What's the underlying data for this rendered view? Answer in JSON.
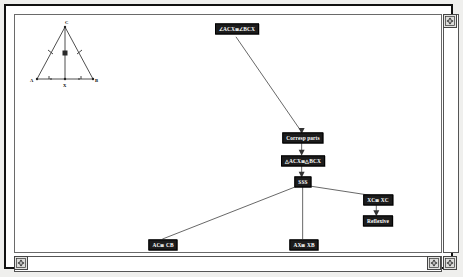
{
  "window": {
    "title": "Geometry Proof Tree",
    "background_color": "#ffffff",
    "frame_color": "#111111",
    "node_fill_color": "#1c1c1c",
    "node_text_color": "#ffffff",
    "edge_color": "#555555"
  },
  "scrollbars": {
    "vertical": {
      "name": "vertical-scrollbar",
      "up_arrow": "⇕"
    },
    "horizontal": {
      "name": "horizontal-scrollbar",
      "left_arrow": "⇔",
      "right_arrow": "⇔"
    },
    "corner": {
      "name": "resize-corner",
      "glyph": "⇕"
    }
  },
  "diagram": {
    "name": "isosceles-triangle-figure",
    "vertex_labels": [
      "A",
      "B",
      "C"
    ],
    "midpoint_label": "X",
    "marks": {
      "leg_ticks": 1,
      "base_ticks": 1,
      "right_angle_mark": true
    }
  },
  "proof_tree": {
    "nodes": [
      {
        "id": "angles",
        "label": "∠ACX≅∠BCX",
        "x": 224,
        "y": 20,
        "name": "node-angle-congruence"
      },
      {
        "id": "corresp",
        "label": "Corresp parts",
        "x": 295,
        "y": 127,
        "name": "node-corresponding-parts"
      },
      {
        "id": "triangles",
        "label": "△ACX≅△BCX",
        "x": 295,
        "y": 150,
        "name": "node-triangle-congruence"
      },
      {
        "id": "sss",
        "label": "SSS",
        "x": 295,
        "y": 171,
        "name": "node-sss"
      },
      {
        "id": "ac-cb",
        "label": "AC≅ CB",
        "x": 152,
        "y": 235,
        "name": "node-ac-congruent-cb"
      },
      {
        "id": "ax-xb",
        "label": "AX≅ XB",
        "x": 296,
        "y": 235,
        "name": "node-ax-congruent-xb"
      },
      {
        "id": "xc-xc",
        "label": "XC≅ XC",
        "x": 370,
        "y": 189,
        "name": "node-xc-congruent-xc"
      },
      {
        "id": "reflexive",
        "label": "Reflexive",
        "x": 370,
        "y": 210,
        "name": "node-reflexive"
      }
    ],
    "edges": [
      {
        "from": "angles",
        "to": "corresp"
      },
      {
        "from": "corresp",
        "to": "triangles"
      },
      {
        "from": "triangles",
        "to": "sss"
      },
      {
        "from": "sss",
        "to": "ac-cb"
      },
      {
        "from": "sss",
        "to": "ax-xb"
      },
      {
        "from": "sss",
        "to": "xc-xc"
      },
      {
        "from": "xc-xc",
        "to": "reflexive"
      }
    ]
  }
}
